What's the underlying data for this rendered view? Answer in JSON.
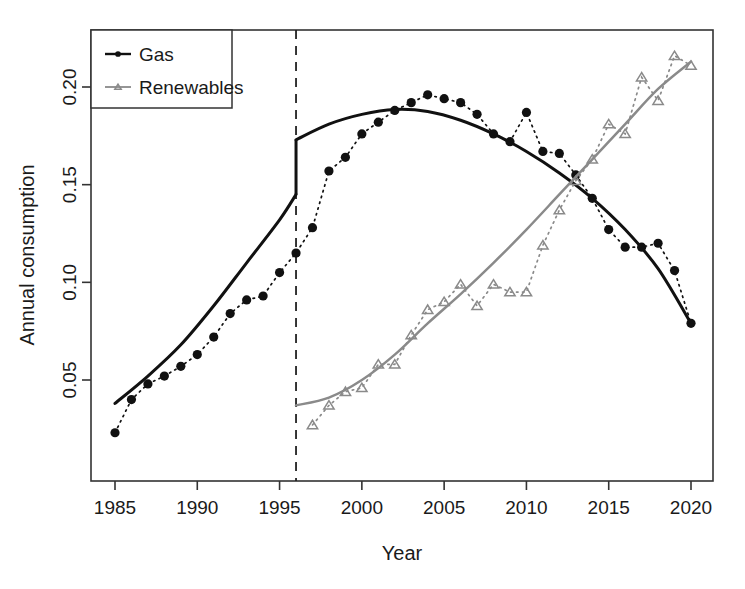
{
  "chart_data": {
    "type": "line",
    "title": "",
    "xlabel": "Year",
    "ylabel": "Annual consumption",
    "xlim": [
      1984.0,
      1991.4
    ],
    "ylim": [
      0.012,
      0.2275
    ],
    "x_ticks": [
      1985,
      1990,
      1995,
      2000,
      2005,
      2010,
      2015,
      2020
    ],
    "y_ticks": [
      0.05,
      0.1,
      0.15,
      0.2
    ],
    "y_tick_labels": [
      "0.05",
      "0.10",
      "0.15",
      "0.20"
    ],
    "x_tick_labels": [
      "1985",
      "1990",
      "1995",
      "2000",
      "2005",
      "2010",
      "2015",
      "2020"
    ],
    "grid": false,
    "legend_position": "top-left",
    "cutoff": {
      "x": 1996,
      "style": "dashed",
      "label": ""
    },
    "x": [
      1985,
      1986,
      1987,
      1988,
      1989,
      1990,
      1991,
      1992,
      1993,
      1994,
      1995,
      1996,
      1997,
      1998,
      1999,
      2000,
      2001,
      2002,
      2003,
      2004,
      2005,
      2006,
      2007,
      2008,
      2009,
      2010,
      2011,
      2012,
      2013,
      2014,
      2015,
      2016,
      2017,
      2018,
      2019,
      2020
    ],
    "series": [
      {
        "name": "Gas",
        "color": "#111111",
        "marker": "filled-circle",
        "line_style": "dotted",
        "values": [
          0.023,
          0.04,
          0.048,
          0.052,
          0.057,
          0.063,
          0.072,
          0.084,
          0.091,
          0.093,
          0.105,
          0.115,
          0.128,
          0.157,
          0.164,
          0.176,
          0.182,
          0.188,
          0.192,
          0.196,
          0.194,
          0.192,
          0.186,
          0.176,
          0.172,
          0.187,
          0.167,
          0.166,
          0.155,
          0.143,
          0.127,
          0.118,
          0.118,
          0.12,
          0.106,
          0.079
        ],
        "fit": {
          "style": "solid",
          "width": 3,
          "pre_x": [
            1985,
            1987,
            1989,
            1991,
            1993,
            1995,
            1996
          ],
          "pre_y": [
            0.038,
            0.052,
            0.068,
            0.088,
            0.11,
            0.132,
            0.145
          ],
          "post_x": [
            1996,
            1998,
            2000,
            2002,
            2004,
            2006,
            2008,
            2010,
            2012,
            2014,
            2016,
            2018,
            2020
          ],
          "post_y": [
            0.173,
            0.181,
            0.186,
            0.1885,
            0.1875,
            0.183,
            0.176,
            0.167,
            0.156,
            0.143,
            0.127,
            0.107,
            0.079
          ]
        }
      },
      {
        "name": "Renewables",
        "color": "#8a8a8a",
        "marker": "open-triangle",
        "line_style": "dotted",
        "values": [
          null,
          null,
          null,
          null,
          null,
          null,
          null,
          null,
          null,
          null,
          null,
          null,
          0.027,
          0.037,
          0.044,
          0.046,
          0.058,
          0.058,
          0.073,
          0.086,
          0.09,
          0.099,
          0.088,
          0.099,
          0.095,
          0.095,
          0.119,
          0.137,
          0.152,
          0.163,
          0.181,
          0.176,
          0.205,
          0.193,
          0.216,
          0.211
        ],
        "fit": {
          "style": "solid",
          "width": 2.5,
          "post_x": [
            1996,
            1998,
            2000,
            2002,
            2004,
            2006,
            2008,
            2010,
            2012,
            2014,
            2016,
            2018,
            2020
          ],
          "post_y": [
            0.037,
            0.041,
            0.05,
            0.063,
            0.079,
            0.094,
            0.11,
            0.127,
            0.145,
            0.163,
            0.181,
            0.199,
            0.213
          ]
        }
      }
    ],
    "legend": [
      {
        "label": "Gas",
        "color": "#111111",
        "marker": "filled-circle"
      },
      {
        "label": "Renewables",
        "color": "#8a8a8a",
        "marker": "open-triangle"
      }
    ]
  }
}
